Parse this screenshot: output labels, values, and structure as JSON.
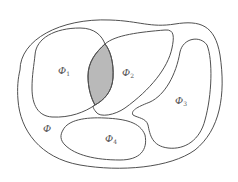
{
  "diagram": {
    "type": "set-regions",
    "colors": {
      "stroke": "#505050",
      "intersection_fill": "#b9b9b9",
      "background": "#ffffff"
    },
    "regions": [
      {
        "id": "outer",
        "symbol": "Φ",
        "subscript": ""
      },
      {
        "id": "phi1",
        "symbol": "Φ",
        "subscript": "1"
      },
      {
        "id": "phi2",
        "symbol": "Φ",
        "subscript": "2"
      },
      {
        "id": "phi3",
        "symbol": "Φ",
        "subscript": "3"
      },
      {
        "id": "phi4",
        "symbol": "Φ",
        "subscript": "4"
      }
    ],
    "intersection": {
      "of": [
        "phi1",
        "phi2"
      ],
      "shaded": true
    }
  }
}
